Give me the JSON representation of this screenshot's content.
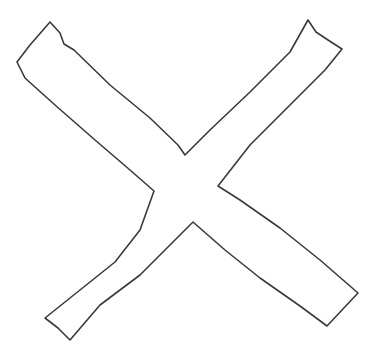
{
  "drawing": {
    "subject": "hand-drawn X (cross) outline",
    "stroke_color": "#3a3a3a",
    "fill_color": "#ffffff",
    "background_color": "#ffffff",
    "outline_points": "50,22 60,33 64,44 74,50 110,85 150,118 178,145 185,155 210,130 250,92 290,52 308,20 316,32 328,40 342,49 325,70 290,105 250,145 218,186 240,200 280,228 320,260 358,293 342,310 327,326 300,306 260,278 225,250 193,222 170,245 140,275 100,305 70,340 58,328 45,318 80,290 115,262 140,230 154,191 130,170 95,140 55,105 25,78 17,62 30,45 50,22"
  }
}
